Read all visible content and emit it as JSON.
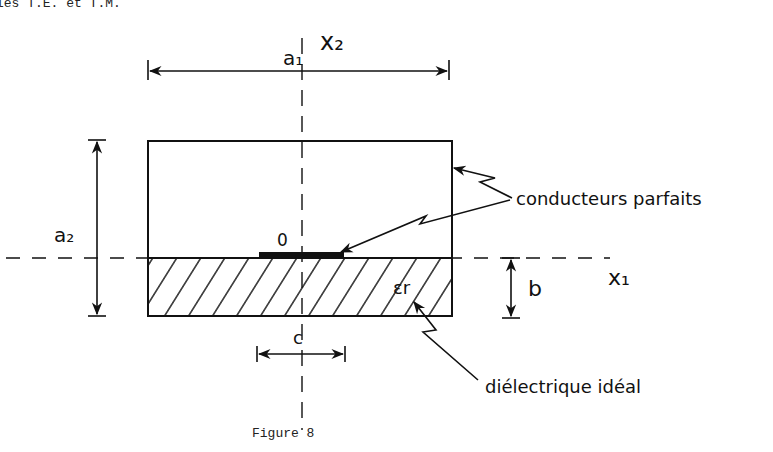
{
  "header": {
    "text": "les T.E. et T.M."
  },
  "figure": {
    "caption": "Figure 8",
    "axes": {
      "vertical": "x₂",
      "horizontal": "x₁",
      "origin": "0"
    },
    "dimensions": {
      "width": "a₁",
      "height": "a₂",
      "substrate": "b",
      "strip": "c"
    },
    "material": "εr",
    "labels": {
      "conductors": "conducteurs parfaits",
      "dielectric": "diélectrique idéal"
    }
  },
  "colors": {
    "ink": "#111111",
    "background": "#ffffff"
  }
}
